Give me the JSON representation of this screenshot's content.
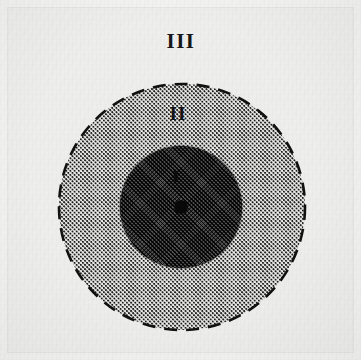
{
  "figure": {
    "width": 361,
    "height": 360,
    "background_color": "#eeeeec",
    "frame_color": "#f3f3f1"
  },
  "chart_data": {
    "type": "diagram",
    "subtype": "concentric-circles",
    "title": "",
    "xlabel": "",
    "ylabel": "",
    "grid": false,
    "legend": "none",
    "center": {
      "x": 182,
      "y": 207
    },
    "zones": [
      {
        "id": "zone-one",
        "label": "I",
        "rank": 1,
        "shape": "circle",
        "radius": 61,
        "center": {
          "x": 181,
          "y": 207
        },
        "fill": "dark-crosshatch",
        "fill_color": "#2a2a2a",
        "border": "none",
        "label_position": {
          "x": 176,
          "y": 176
        },
        "label_color": "#0c0c0c"
      },
      {
        "id": "zone-two",
        "label": "II",
        "rank": 2,
        "shape": "circle",
        "radius": 123,
        "center": {
          "x": 182,
          "y": 207
        },
        "fill": "stipple-dot-pattern",
        "fill_color": "#f2f2f0",
        "dot_color": "#1b1b1b",
        "border": "dashed",
        "border_color": "#111111",
        "label_position": {
          "x": 178,
          "y": 113
        },
        "label_color": "#141417"
      },
      {
        "id": "zone-three",
        "label": "III",
        "rank": 3,
        "shape": "field",
        "radius": null,
        "center": null,
        "fill": "plain",
        "fill_color": "#eeeeec",
        "border": "none",
        "label_position": {
          "x": 181,
          "y": 41
        },
        "label_color": "#17171a"
      }
    ],
    "markers": [
      {
        "id": "center-point",
        "label": "",
        "shape": "filled-circle",
        "radius": 7,
        "position": {
          "x": 181,
          "y": 207
        },
        "color": "#080808"
      }
    ]
  },
  "labels": {
    "zone_three": "III",
    "zone_two": "II",
    "zone_one": "I"
  }
}
